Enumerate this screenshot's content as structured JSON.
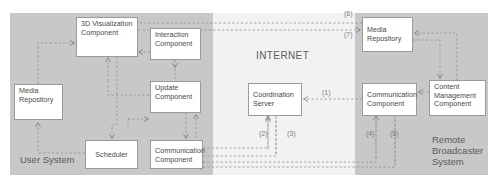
{
  "diagram": {
    "panels": [
      {
        "id": "user-system",
        "label": "User System",
        "fill": "#c8c8c8"
      },
      {
        "id": "internet",
        "label": "INTERNET",
        "fill": "#f2f2f2"
      },
      {
        "id": "remote-broadcaster",
        "label": "Remote\nBroadcaster\nSystem",
        "fill": "#c8c8c8"
      }
    ],
    "panel_labels": {
      "user_system": "User System",
      "internet": "INTERNET",
      "remote_line1": "Remote",
      "remote_line2": "Broadcaster",
      "remote_line3": "System"
    },
    "nodes": [
      {
        "id": "3d-visualization-component",
        "panel": "user-system",
        "line1": "3D Visualization",
        "line2": "Component"
      },
      {
        "id": "interaction-component",
        "panel": "user-system",
        "line1": "Interaction",
        "line2": "Component"
      },
      {
        "id": "media-repository-user",
        "panel": "user-system",
        "line1": "Media",
        "line2": "Repository"
      },
      {
        "id": "update-component",
        "panel": "user-system",
        "line1": "Update",
        "line2": "Component"
      },
      {
        "id": "scheduler",
        "panel": "user-system",
        "line1": "Scheduler",
        "line2": ""
      },
      {
        "id": "communication-component-user",
        "panel": "user-system",
        "line1": "Communication",
        "line2": "Component"
      },
      {
        "id": "coordination-server",
        "panel": "internet",
        "line1": "Coordination",
        "line2": "Server"
      },
      {
        "id": "media-repository-remote",
        "panel": "remote-broadcaster",
        "line1": "Media",
        "line2": "Repository"
      },
      {
        "id": "communication-component-remote",
        "panel": "remote-broadcaster",
        "line1": "Communication",
        "line2": "Component"
      },
      {
        "id": "content-management-component",
        "panel": "remote-broadcaster",
        "line1": "Content",
        "line2": "Management",
        "line3": "Component"
      }
    ],
    "connection_labels": [
      {
        "id": "c1",
        "text": "(1)"
      },
      {
        "id": "c2",
        "text": "(2)"
      },
      {
        "id": "c3",
        "text": "(3)"
      },
      {
        "id": "c4",
        "text": "(4)"
      },
      {
        "id": "c5",
        "text": "(5)"
      },
      {
        "id": "c6",
        "text": "(6)"
      },
      {
        "id": "c7",
        "text": "(7)"
      }
    ],
    "colors": {
      "panel_gray": "#c8c8c8",
      "internet_gray": "#f2f2f2",
      "box_fill": "#ffffff",
      "box_border": "#9a9a9a",
      "wire": "#8d8d8d",
      "text": "#4a4a4a",
      "label_text": "#5a5a5a"
    }
  }
}
